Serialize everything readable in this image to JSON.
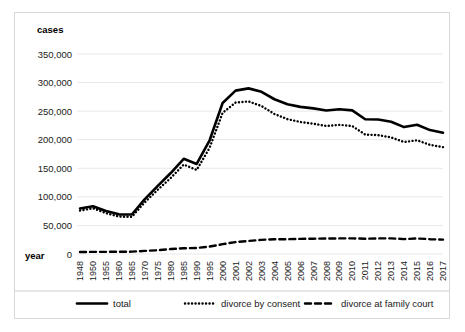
{
  "chart_data": {
    "type": "line",
    "title": "",
    "xlabel": "year",
    "ylabel": "cases",
    "ylim": [
      0,
      350000
    ],
    "yticks": [
      0,
      50000,
      100000,
      150000,
      200000,
      250000,
      300000,
      350000
    ],
    "ytick_labels": [
      "0",
      "50,000",
      "100,000",
      "150,000",
      "200,000",
      "250,000",
      "300,000",
      "350,000"
    ],
    "grid": true,
    "legend_position": "bottom",
    "categories": [
      "1948",
      "1950",
      "1955",
      "1960",
      "1965",
      "1970",
      "1975",
      "1980",
      "1985",
      "1990",
      "1995",
      "2000",
      "2001",
      "2002",
      "2003",
      "2004",
      "2005",
      "2006",
      "2007",
      "2008",
      "2009",
      "2010",
      "2011",
      "2012",
      "2013",
      "2014",
      "2015",
      "2016",
      "2017"
    ],
    "series": [
      {
        "name": "total",
        "style": "solid",
        "color": "#000000",
        "values": [
          79551,
          83689,
          75267,
          69410,
          69067,
          95937,
          119135,
          141689,
          166640,
          157608,
          199016,
          264246,
          285911,
          289836,
          283854,
          270804,
          261917,
          257475,
          254832,
          251136,
          253353,
          251378,
          235719,
          235406,
          231383,
          222107,
          226215,
          216856,
          212262
        ]
      },
      {
        "name": "divorce by consent",
        "style": "dotted",
        "color": "#000000",
        "values": [
          76000,
          80000,
          71500,
          65500,
          65000,
          90500,
          112500,
          133000,
          156500,
          147000,
          186000,
          247000,
          265000,
          267000,
          259000,
          245000,
          236000,
          231000,
          228000,
          224000,
          226000,
          224000,
          209000,
          208000,
          204000,
          196000,
          199000,
          191000,
          187000
        ]
      },
      {
        "name": "divorce at family court",
        "style": "dashed",
        "color": "#000000",
        "values": [
          3500,
          3700,
          3800,
          3900,
          4100,
          5400,
          6600,
          8700,
          10100,
          10600,
          13000,
          17200,
          20900,
          22800,
          24800,
          25800,
          25900,
          26500,
          26800,
          27100,
          27300,
          27400,
          26700,
          27300,
          27400,
          26100,
          27200,
          25900,
          25200
        ]
      }
    ]
  },
  "legend": [
    {
      "label": "total",
      "style": "solid"
    },
    {
      "label": "divorce by consent",
      "style": "dotted"
    },
    {
      "label": "divorce at family court",
      "style": "dashed"
    }
  ]
}
